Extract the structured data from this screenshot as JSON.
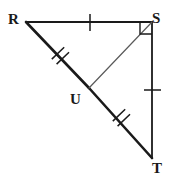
{
  "figure": {
    "type": "geometry-diagram",
    "width": 173,
    "height": 181,
    "background_color": "#ffffff",
    "stroke_color": "#1a1a1a",
    "labels": {
      "R": "R",
      "S": "S",
      "T": "T",
      "U": "U"
    },
    "points": {
      "R": {
        "x": 26,
        "y": 22
      },
      "S": {
        "x": 152,
        "y": 22
      },
      "T": {
        "x": 152,
        "y": 158
      },
      "U": {
        "x": 89,
        "y": 88
      }
    },
    "segments": [
      {
        "name": "RS",
        "from": "R",
        "to": "S",
        "width": 1.8,
        "ticks": 1,
        "tick_style": "perpendicular"
      },
      {
        "name": "ST",
        "from": "S",
        "to": "T",
        "width": 1.8,
        "ticks": 1,
        "tick_style": "perpendicular"
      },
      {
        "name": "RU",
        "from": "R",
        "to": "U",
        "width": 2.6,
        "ticks": 2,
        "tick_style": "perpendicular"
      },
      {
        "name": "UT",
        "from": "U",
        "to": "T",
        "width": 2.6,
        "ticks": 2,
        "tick_style": "perpendicular"
      },
      {
        "name": "US",
        "from": "U",
        "to": "S",
        "width": 1.2,
        "ticks": 0,
        "tick_style": "none"
      }
    ],
    "right_angle": {
      "at_vertex": "S",
      "marker": "square",
      "size": 12,
      "between": [
        "RS",
        "ST"
      ]
    },
    "congruence_marks": {
      "single_tick": [
        "RS",
        "ST"
      ],
      "double_tick": [
        "RU",
        "UT"
      ]
    }
  }
}
